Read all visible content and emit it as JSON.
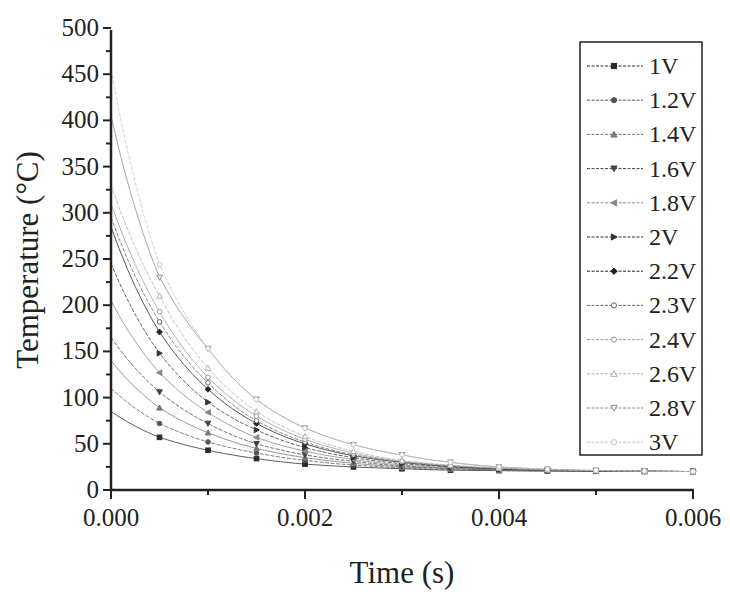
{
  "chart_data": {
    "type": "line",
    "title": "",
    "xlabel": "Time (s)",
    "ylabel": "Temperature (°C)",
    "xlim": [
      0,
      0.006
    ],
    "ylim": [
      0,
      500
    ],
    "x_ticks": [
      "0.000",
      "0.002",
      "0.004",
      "0.006"
    ],
    "x_tick_values": [
      0,
      0.002,
      0.004,
      0.006
    ],
    "y_ticks": [
      "0",
      "50",
      "100",
      "150",
      "200",
      "250",
      "300",
      "350",
      "400",
      "450",
      "500"
    ],
    "y_tick_values": [
      0,
      50,
      100,
      150,
      200,
      250,
      300,
      350,
      400,
      450,
      500
    ],
    "grid": false,
    "legend_position": "upper right (inside)",
    "x": [
      0,
      0.0005,
      0.001,
      0.0015,
      0.002,
      0.0025,
      0.003,
      0.0035,
      0.004,
      0.0045,
      0.005,
      0.0055,
      0.006
    ],
    "series": [
      {
        "name": "1V",
        "marker": "square",
        "color": "#2a2a2a",
        "values": [
          85,
          57,
          43,
          34,
          28,
          25,
          23,
          21.5,
          21,
          20.5,
          20.3,
          20.1,
          20
        ]
      },
      {
        "name": "1.2V",
        "marker": "circle-filled",
        "color": "#555555",
        "values": [
          110,
          72,
          52,
          40,
          32,
          27,
          24,
          22,
          21,
          20.6,
          20.3,
          20.1,
          20
        ]
      },
      {
        "name": "1.4V",
        "marker": "triangle-up",
        "color": "#777777",
        "values": [
          140,
          89,
          62,
          45,
          35,
          29,
          25,
          23,
          21.5,
          20.8,
          20.4,
          20.2,
          20
        ]
      },
      {
        "name": "1.6V",
        "marker": "triangle-down",
        "color": "#444444",
        "values": [
          165,
          106,
          72,
          50,
          38,
          31,
          26,
          23.5,
          22,
          21,
          20.5,
          20.2,
          20
        ]
      },
      {
        "name": "1.8V",
        "marker": "triangle-left",
        "color": "#888888",
        "values": [
          205,
          127,
          84,
          57,
          42,
          33,
          27,
          24,
          22.3,
          21.2,
          20.6,
          20.3,
          20
        ]
      },
      {
        "name": "2V",
        "marker": "triangle-right",
        "color": "#333333",
        "values": [
          245,
          148,
          95,
          65,
          46,
          35,
          28.5,
          25,
          22.7,
          21.4,
          20.7,
          20.3,
          20
        ]
      },
      {
        "name": "2.2V",
        "marker": "diamond",
        "color": "#222222",
        "values": [
          285,
          171,
          109,
          72,
          50,
          37,
          30,
          25.5,
          23,
          21.6,
          20.8,
          20.4,
          20
        ]
      },
      {
        "name": "2.3V",
        "marker": "circle-open",
        "color": "#666666",
        "values": [
          295,
          182,
          116,
          75,
          52,
          38,
          30.5,
          26,
          23.2,
          21.7,
          20.9,
          20.4,
          20
        ]
      },
      {
        "name": "2.4V",
        "marker": "circle-open",
        "color": "#999999",
        "values": [
          310,
          193,
          122,
          80,
          55,
          40,
          31,
          26.5,
          23.5,
          21.8,
          21,
          20.5,
          20
        ]
      },
      {
        "name": "2.6V",
        "marker": "triangle-up-open",
        "color": "#b0b0b0",
        "values": [
          330,
          210,
          132,
          85,
          58,
          42,
          32,
          27,
          23.8,
          22,
          21,
          20.5,
          20
        ]
      },
      {
        "name": "2.8V",
        "marker": "triangle-down-open",
        "color": "#8c8c8c",
        "values": [
          405,
          230,
          153,
          98,
          67,
          49,
          38,
          30,
          25,
          22.5,
          21.2,
          20.6,
          20
        ]
      },
      {
        "name": "3V",
        "marker": "circle-open",
        "color": "#c4c4c4",
        "values": [
          455,
          244,
          153,
          98,
          67,
          49,
          38,
          30,
          25,
          22.5,
          21.2,
          20.6,
          20
        ]
      }
    ]
  },
  "legend": {
    "items": [
      "1V",
      "1.2V",
      "1.4V",
      "1.6V",
      "1.8V",
      "2V",
      "2.2V",
      "2.3V",
      "2.4V",
      "2.6V",
      "2.8V",
      "3V"
    ]
  },
  "axes": {
    "x_title": "Time (s)",
    "y_title": "Temperature (°C)"
  }
}
